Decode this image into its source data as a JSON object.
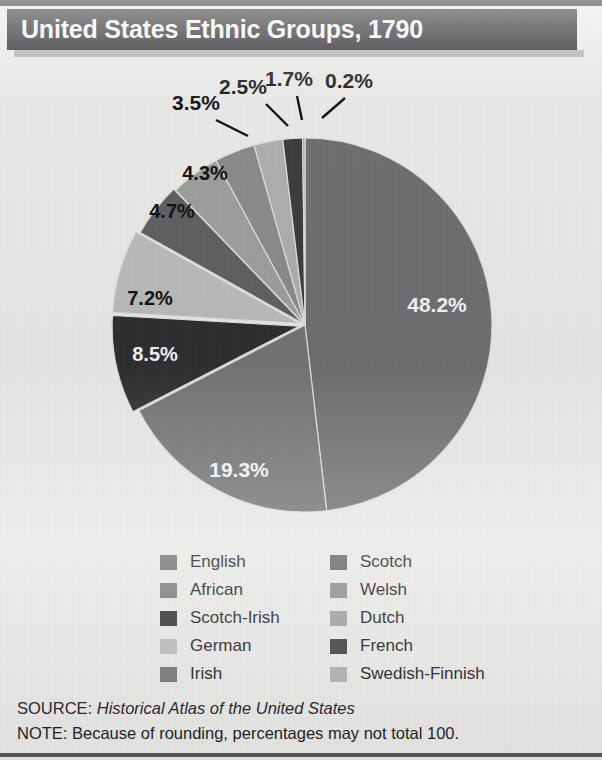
{
  "header": {
    "title": "United States Ethnic Groups, 1790"
  },
  "footer": {
    "source_label": "SOURCE:",
    "source_title": "Historical Atlas of the United States",
    "note": "NOTE: Because of rounding, percentages may not total 100."
  },
  "legend": {
    "left_column": [
      {
        "label": "English",
        "color": "#6e6e70"
      },
      {
        "label": "African",
        "color": "#767678"
      },
      {
        "label": "Scotch-Irish",
        "color": "#2e2e31"
      },
      {
        "label": "German",
        "color": "#b9b9b7"
      },
      {
        "label": "Irish",
        "color": "#737375"
      }
    ],
    "right_column": [
      {
        "label": "Scotch",
        "color": "#5f5f61"
      },
      {
        "label": "Welsh",
        "color": "#8a8a8a"
      },
      {
        "label": "Dutch",
        "color": "#9d9d9c"
      },
      {
        "label": "French",
        "color": "#3c3c3f"
      },
      {
        "label": "Swedish-Finnish",
        "color": "#adadab"
      }
    ]
  },
  "chart_data": {
    "type": "pie",
    "title": "United States Ethnic Groups, 1790",
    "unit": "%",
    "start_angle_deg": 0,
    "direction": "clockwise",
    "center": {
      "x": 305,
      "y": 267
    },
    "radius": 187,
    "categories": [
      "English",
      "Irish",
      "Scotch-Irish",
      "German",
      "Scotch",
      "Dutch",
      "Welsh",
      "French",
      "Swedish-Finnish",
      "African"
    ],
    "values": [
      48.2,
      19.3,
      8.5,
      7.2,
      4.7,
      4.3,
      3.5,
      2.5,
      1.7,
      0.2
    ],
    "slices": [
      {
        "label": "English",
        "value": 48.2,
        "text": "48.2%",
        "color": "#6e6e70",
        "label_placement": "inside",
        "label_fill": "light",
        "label_x": 437,
        "label_y": 254,
        "explode": 0
      },
      {
        "label": "Irish",
        "value": 19.3,
        "text": "19.3%",
        "color": "#737375",
        "label_placement": "inside",
        "label_fill": "light",
        "label_x": 239,
        "label_y": 419,
        "explode": 0
      },
      {
        "label": "Scotch-Irish",
        "value": 8.5,
        "text": "8.5%",
        "color": "#2e2e31",
        "label_placement": "inside",
        "label_fill": "light",
        "label_x": 155,
        "label_y": 303,
        "explode": 6
      },
      {
        "label": "German",
        "value": 7.2,
        "text": "7.2%",
        "color": "#b9b9b7",
        "label_placement": "inside",
        "label_fill": "dark",
        "label_x": 150,
        "label_y": 247,
        "explode": 6
      },
      {
        "label": "Scotch",
        "value": 4.7,
        "text": "4.7%",
        "color": "#5f5f61",
        "label_placement": "inside",
        "label_fill": "dark",
        "label_x": 172,
        "label_y": 160,
        "explode": 2
      },
      {
        "label": "Dutch",
        "value": 4.3,
        "text": "4.3%",
        "color": "#9d9d9c",
        "label_placement": "inside",
        "label_fill": "dark",
        "label_x": 205,
        "label_y": 122,
        "explode": 0
      },
      {
        "label": "Welsh",
        "value": 3.5,
        "text": "3.5%",
        "color": "#8a8a8a",
        "label_placement": "outside",
        "label_fill": "dark",
        "label_x": 196,
        "label_y": 52,
        "leader": [
          216,
          62,
          248,
          78
        ],
        "explode": 0
      },
      {
        "label": "Swedish-Finnish",
        "value": 2.5,
        "text": "2.5%",
        "color": "#adadab",
        "label_placement": "outside",
        "label_fill": "dark",
        "label_x": 243,
        "label_y": 36,
        "leader": [
          266,
          46,
          288,
          68
        ],
        "explode": 0
      },
      {
        "label": "French",
        "value": 1.7,
        "text": "1.7%",
        "color": "#3c3c3f",
        "label_placement": "outside",
        "label_fill": "dark",
        "label_x": 289,
        "label_y": 28,
        "leader": [
          297,
          38,
          302,
          62
        ],
        "explode": 0
      },
      {
        "label": "African",
        "value": 0.2,
        "text": "0.2%",
        "color": "#9a9a9c",
        "label_placement": "outside",
        "label_fill": "dark",
        "label_x": 349,
        "label_y": 30,
        "leader": [
          345,
          40,
          322,
          60
        ],
        "explode": 0
      }
    ]
  }
}
